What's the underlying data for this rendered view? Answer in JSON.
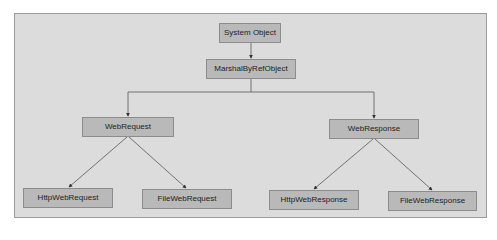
{
  "diagram": {
    "type": "class-hierarchy",
    "colors": {
      "background": "#ffffff",
      "panel": "#dcdcdc",
      "panel_border": "#9a9a9a",
      "node_fill": "#b9b9b9",
      "node_border": "#8c8c8c",
      "edge": "#555555",
      "text": "#222222"
    },
    "nodes": {
      "system_object": {
        "label": "System Object"
      },
      "marshal_by_ref_object": {
        "label": "MarshalByRefObject"
      },
      "web_request": {
        "label": "WebRequest"
      },
      "web_response": {
        "label": "WebResponse"
      },
      "http_web_request": {
        "label": "HttpWebRequest"
      },
      "file_web_request": {
        "label": "FileWebRequest"
      },
      "http_web_response": {
        "label": "HttpWebResponse"
      },
      "file_web_response": {
        "label": "FileWebResponse"
      }
    },
    "edges": [
      {
        "from": "System Object",
        "to": "MarshalByRefObject"
      },
      {
        "from": "MarshalByRefObject",
        "to": "WebRequest"
      },
      {
        "from": "MarshalByRefObject",
        "to": "WebResponse"
      },
      {
        "from": "WebRequest",
        "to": "HttpWebRequest"
      },
      {
        "from": "WebRequest",
        "to": "FileWebRequest"
      },
      {
        "from": "WebResponse",
        "to": "HttpWebResponse"
      },
      {
        "from": "WebResponse",
        "to": "FileWebResponse"
      }
    ]
  }
}
